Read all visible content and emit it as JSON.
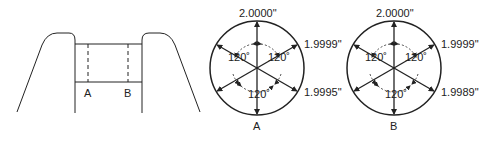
{
  "profile": {
    "section_labels": [
      "A",
      "B"
    ]
  },
  "gauges": [
    {
      "id": "A",
      "label": "A",
      "readings": {
        "top": "2.0000\"",
        "upper_right": "1.9999\"",
        "lower_right": "1.9995\""
      },
      "angles": [
        "120˚",
        "120˚",
        "120˚"
      ]
    },
    {
      "id": "B",
      "label": "B",
      "readings": {
        "top": "2.0000\"",
        "upper_right": "1.9999\"",
        "lower_right": "1.9989\""
      },
      "angles": [
        "120˚",
        "120˚",
        "120˚"
      ]
    }
  ],
  "colors": {
    "line": "#222222",
    "background": "#ffffff"
  }
}
